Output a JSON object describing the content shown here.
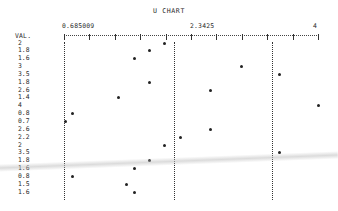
{
  "chart_data": {
    "type": "scatter",
    "title": "U CHART",
    "ylabel": "VAL.",
    "xlabel": "",
    "x_axis_labels": [
      "0.685009",
      "2.3425",
      "4"
    ],
    "xlim": [
      0.685009,
      4
    ],
    "grid": false,
    "legend": null,
    "control_limits": {
      "lcl": 0.685009,
      "center": 2.12,
      "ucl": 3.4
    },
    "rows": [
      {
        "label": "2",
        "value": 2.0
      },
      {
        "label": "1.8",
        "value": 1.8
      },
      {
        "label": "1.6",
        "value": 1.6
      },
      {
        "label": "3",
        "value": 3.0
      },
      {
        "label": "3.5",
        "value": 3.5
      },
      {
        "label": "1.8",
        "value": 1.8
      },
      {
        "label": "2.6",
        "value": 2.6
      },
      {
        "label": "1.4",
        "value": 1.4
      },
      {
        "label": "4",
        "value": 4.0
      },
      {
        "label": "0.8",
        "value": 0.8
      },
      {
        "label": "0.7",
        "value": 0.7
      },
      {
        "label": "2.6",
        "value": 2.6
      },
      {
        "label": "2.2",
        "value": 2.2
      },
      {
        "label": "2",
        "value": 2.0
      },
      {
        "label": "3.5",
        "value": 3.5
      },
      {
        "label": "1.8",
        "value": 1.8
      },
      {
        "label": "1.6",
        "value": 1.6
      },
      {
        "label": "0.8",
        "value": 0.8
      },
      {
        "label": "1.5",
        "value": 1.5
      },
      {
        "label": "1.6",
        "value": 1.6
      }
    ]
  },
  "chart": {
    "title": "U CHART",
    "header_label": "VAL.",
    "axis_min_label": "0.685009",
    "axis_mid_label": "2.3425",
    "axis_max_label": "4"
  }
}
